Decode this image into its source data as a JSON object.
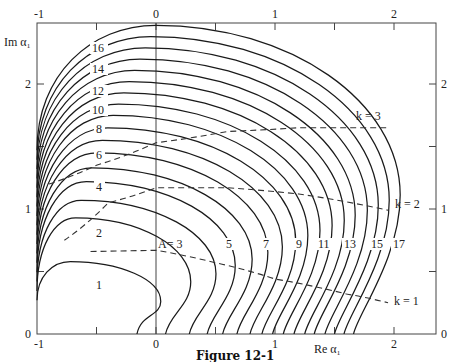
{
  "figure": {
    "caption": "Figure 12-1",
    "xlabel": "Re α₁",
    "ylabel": "Im α₁"
  },
  "axes": {
    "top_ticks": [
      {
        "v": -1,
        "label": "-1"
      },
      {
        "v": 0,
        "label": "0"
      },
      {
        "v": 1,
        "label": "1"
      },
      {
        "v": 2,
        "label": "2"
      }
    ],
    "bottom_ticks": [
      {
        "v": -1,
        "label": "-1"
      },
      {
        "v": 0,
        "label": "0"
      },
      {
        "v": 1,
        "label": "1"
      },
      {
        "v": 2,
        "label": "2"
      }
    ],
    "left_ticks": [
      {
        "v": 0,
        "label": "0"
      },
      {
        "v": 1,
        "label": "1"
      },
      {
        "v": 2,
        "label": "2"
      }
    ],
    "right_ticks": [
      {
        "v": 0,
        "label": "0"
      },
      {
        "v": 1,
        "label": "1"
      },
      {
        "v": 2,
        "label": "2"
      }
    ],
    "minor_ticks_x": [
      -0.5,
      0.5,
      1.5
    ],
    "minor_ticks_y": [
      0.5,
      1.5
    ]
  },
  "chart_data": {
    "type": "line",
    "title": "Figure 12-1",
    "xlabel": "Re α₁",
    "ylabel": "Im α₁",
    "xlim": [
      -1,
      2.35
    ],
    "ylim": [
      0,
      2.49
    ],
    "grid": false,
    "contour_labels_A": [
      "1",
      "2",
      "3",
      "4",
      "5",
      "6",
      "7",
      "8",
      "9",
      "10",
      "11",
      "12",
      "13",
      "14",
      "15",
      "16",
      "17"
    ],
    "A_contours": [
      {
        "A": 1,
        "x_intercept": -0.16,
        "peak_y": 0.58
      },
      {
        "A": 2,
        "x_intercept": 0.08,
        "peak_y": 0.93
      },
      {
        "A": 3,
        "x_intercept": 0.28,
        "peak_y": 1.07
      },
      {
        "A": 4,
        "x_intercept": 0.43,
        "peak_y": 1.22
      },
      {
        "A": 5,
        "x_intercept": 0.56,
        "peak_y": 1.33
      },
      {
        "A": 6,
        "x_intercept": 0.68,
        "peak_y": 1.45
      },
      {
        "A": 7,
        "x_intercept": 0.79,
        "peak_y": 1.55
      },
      {
        "A": 8,
        "x_intercept": 0.89,
        "peak_y": 1.65
      },
      {
        "A": 9,
        "x_intercept": 0.98,
        "peak_y": 1.75
      },
      {
        "A": 10,
        "x_intercept": 1.07,
        "peak_y": 1.84
      },
      {
        "A": 11,
        "x_intercept": 1.16,
        "peak_y": 1.93
      },
      {
        "A": 12,
        "x_intercept": 1.25,
        "peak_y": 2.02
      },
      {
        "A": 13,
        "x_intercept": 1.33,
        "peak_y": 2.11
      },
      {
        "A": 14,
        "x_intercept": 1.42,
        "peak_y": 2.2
      },
      {
        "A": 15,
        "x_intercept": 1.5,
        "peak_y": 2.29
      },
      {
        "A": 16,
        "x_intercept": 1.58,
        "peak_y": 2.38
      },
      {
        "A": 17,
        "x_intercept": 1.66,
        "peak_y": 2.47
      }
    ],
    "k_curves": [
      {
        "k": 1,
        "label": "k = 1",
        "points": [
          [
            -0.55,
            0.66
          ],
          [
            0,
            0.67
          ],
          [
            0.5,
            0.57
          ],
          [
            1.0,
            0.44
          ],
          [
            1.6,
            0.32
          ],
          [
            1.95,
            0.25
          ]
        ]
      },
      {
        "k": 2,
        "label": "k = 2",
        "points": [
          [
            -0.77,
            0.75
          ],
          [
            -0.4,
            1.05
          ],
          [
            0,
            1.17
          ],
          [
            0.6,
            1.17
          ],
          [
            1.2,
            1.12
          ],
          [
            1.95,
            0.99
          ]
        ]
      },
      {
        "k": 3,
        "label": "k = 3",
        "points": [
          [
            -0.9,
            1.2
          ],
          [
            -0.5,
            1.35
          ],
          [
            0,
            1.53
          ],
          [
            0.6,
            1.62
          ],
          [
            1.2,
            1.65
          ],
          [
            1.95,
            1.65
          ]
        ]
      }
    ]
  },
  "labels": {
    "A_prefix": "A= 3",
    "k1": "k = 1",
    "k2": "k = 2",
    "k3": "k = 3"
  },
  "plot_px": {
    "left": 37,
    "right": 436,
    "top": 23,
    "bottom": 334,
    "x0": 156,
    "xscale": 119,
    "y0": 334,
    "yscale": 125
  }
}
